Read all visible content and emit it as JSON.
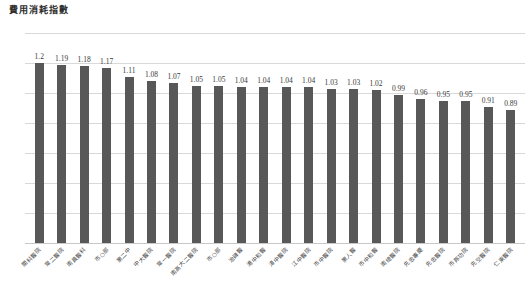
{
  "chart_data": {
    "type": "bar",
    "title": "費用消耗指數",
    "xlabel": "",
    "ylabel": "",
    "ylim": [
      0,
      1.4
    ],
    "yticks": [
      "0",
      "0.2",
      "0.4",
      "0.6",
      "0.8",
      "1",
      "1.2",
      "1.4"
    ],
    "ytick_values": [
      0,
      0.2,
      0.4,
      0.6,
      0.8,
      1,
      1.2,
      1.4
    ],
    "grid": true,
    "legend": false,
    "bar_color": "#585858",
    "grid_color": "#d9d9d9",
    "categories": [
      "關科醫院",
      "常二醫院",
      "南員醫科",
      "市○部",
      "第二中",
      "中大醫院",
      "常一醫院",
      "南高大二醫院",
      "市○部",
      "治碑醫",
      "港中和醫",
      "漳中醫院",
      "江中醫院",
      "市中醫院",
      "第人醫",
      "市中和醫",
      "南總醫院",
      "先忠專慶",
      "先忠醫院",
      "市邦功院",
      "先空醫院",
      "仁東醫院"
    ],
    "values": [
      1.2,
      1.19,
      1.18,
      1.17,
      1.11,
      1.08,
      1.07,
      1.05,
      1.05,
      1.04,
      1.04,
      1.04,
      1.04,
      1.03,
      1.03,
      1.02,
      0.99,
      0.96,
      0.95,
      0.95,
      0.91,
      0.89
    ],
    "value_labels": [
      "1.2",
      "1.19",
      "1.18",
      "1.17",
      "1.11",
      "1.08",
      "1.07",
      "1.05",
      "1.05",
      "1.04",
      "1.04",
      "1.04",
      "1.04",
      "1.03",
      "1.03",
      "1.02",
      "0.99",
      "0.96",
      "0.95",
      "0.95",
      "0.91",
      "0.89"
    ]
  }
}
